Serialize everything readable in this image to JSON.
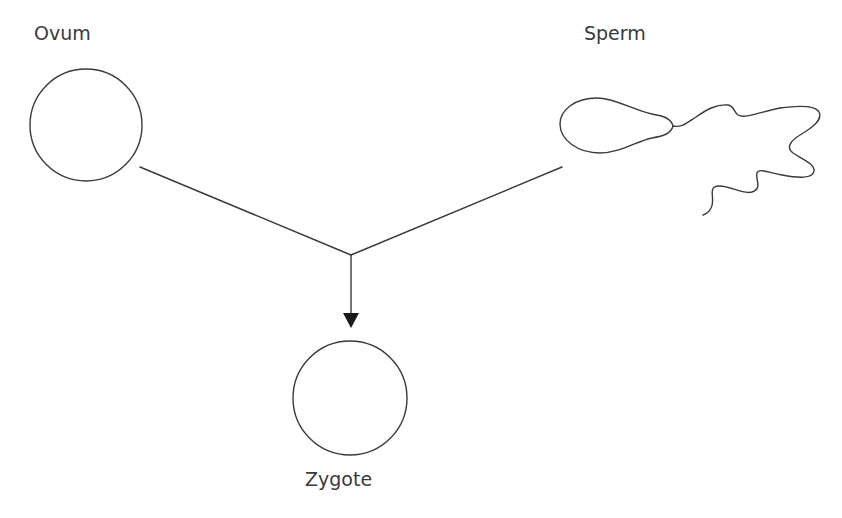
{
  "diagram": {
    "type": "fertilization",
    "stroke_color": "#3a3a3a",
    "nodes": {
      "ovum": {
        "label": "Ovum",
        "shape": "circle"
      },
      "sperm": {
        "label": "Sperm",
        "shape": "sperm-cell"
      },
      "zygote": {
        "label": "Zygote",
        "shape": "circle"
      }
    },
    "edges": [
      {
        "from": "ovum",
        "to": "junction"
      },
      {
        "from": "sperm",
        "to": "junction"
      },
      {
        "from": "junction",
        "to": "zygote",
        "arrow": true
      }
    ]
  }
}
